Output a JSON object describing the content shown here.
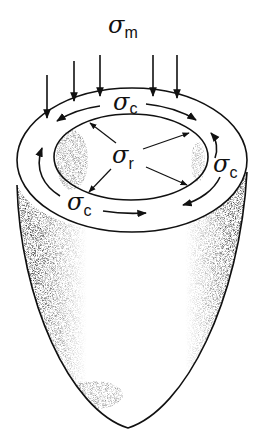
{
  "figure": {
    "labels": {
      "meridional": {
        "symbol": "σ",
        "subscript": "m"
      },
      "circumferential_top": {
        "symbol": "σ",
        "subscript": "c"
      },
      "circumferential_right": {
        "symbol": "σ",
        "subscript": "c"
      },
      "circumferential_bottom": {
        "symbol": "σ",
        "subscript": "c"
      },
      "radial": {
        "symbol": "σ",
        "subscript": "r"
      }
    },
    "arrow_counts": {
      "meridional_downward": 5,
      "radial_outward": 4,
      "circumferential_paths": 4
    },
    "colors": {
      "ink": "#111111",
      "background": "#ffffff",
      "shading": "#555555"
    }
  }
}
